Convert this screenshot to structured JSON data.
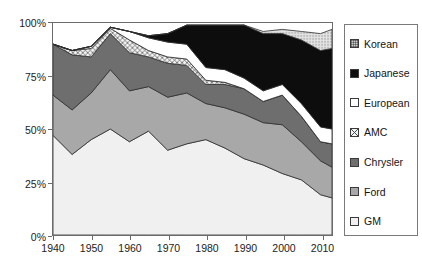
{
  "chart_data": {
    "type": "area",
    "stacked": true,
    "title": "",
    "subtitle": "",
    "xlabel": "",
    "ylabel": "",
    "xlim": [
      1940,
      2013
    ],
    "ylim": [
      0,
      100
    ],
    "grid": false,
    "legend_position": "right",
    "x_tick_labels": [
      "1940",
      "1950",
      "1960",
      "1970",
      "1980",
      "1990",
      "2000",
      "2010"
    ],
    "x_ticks": [
      1940,
      1950,
      1960,
      1970,
      1980,
      1990,
      2000,
      2010
    ],
    "y_tick_labels": [
      "0%",
      "25%",
      "50%",
      "75%",
      "100%"
    ],
    "y_ticks": [
      0,
      25,
      50,
      75,
      100
    ],
    "x": [
      1940,
      1945,
      1950,
      1955,
      1960,
      1965,
      1970,
      1975,
      1980,
      1985,
      1990,
      1995,
      2000,
      2005,
      2010,
      2013
    ],
    "series": [
      {
        "name": "GM",
        "fill": "#e6e6e6",
        "pattern": "solid",
        "values": [
          47,
          38,
          45,
          50,
          44,
          49,
          40,
          43,
          45,
          41,
          36,
          33,
          29,
          26,
          19,
          17.5
        ]
      },
      {
        "name": "Ford",
        "fill": "#a8a8a8",
        "pattern": "solid",
        "values": [
          19,
          21,
          22,
          28,
          24,
          21,
          25,
          24,
          17,
          19,
          21,
          20,
          23,
          18,
          16,
          14.5
        ]
      },
      {
        "name": "Chrysler",
        "fill": "#6e6e6e",
        "pattern": "solid",
        "values": [
          24,
          26,
          17,
          17,
          18,
          14,
          16,
          13,
          9,
          11,
          12,
          10,
          14,
          12,
          9,
          11
        ]
      },
      {
        "name": "AMC",
        "fill": "#f2f2f2",
        "pattern": "crosshatch",
        "values": [
          0,
          2,
          4,
          2.5,
          6,
          3,
          3,
          3,
          2,
          1,
          0,
          0,
          0,
          0,
          0,
          0
        ]
      },
      {
        "name": "European",
        "fill": "#ffffff",
        "pattern": "solid",
        "values": [
          0,
          0,
          1,
          0.5,
          4,
          6,
          7,
          7,
          6,
          6,
          5,
          5,
          5,
          6,
          7,
          7
        ]
      },
      {
        "name": "Japanese",
        "fill": "#0d0d0d",
        "pattern": "solid",
        "values": [
          0,
          0,
          0,
          0,
          0,
          1,
          4,
          9,
          20,
          21,
          25,
          27,
          24,
          30,
          36,
          38
        ]
      },
      {
        "name": "Korean",
        "fill": "#d2d2d2",
        "pattern": "dotted",
        "values": [
          0,
          0,
          0,
          0,
          0,
          0,
          0,
          0,
          0,
          0,
          0,
          1,
          2,
          4,
          8,
          9
        ]
      }
    ]
  },
  "legend": {
    "items": [
      {
        "label": "Korean",
        "swatch": "dotted-swatch"
      },
      {
        "label": "Japanese",
        "swatch": "black-swatch"
      },
      {
        "label": "European",
        "swatch": "white-swatch"
      },
      {
        "label": "AMC",
        "swatch": "crosshatch-swatch"
      },
      {
        "label": "Chrysler",
        "swatch": "darkgray-swatch"
      },
      {
        "label": "Ford",
        "swatch": "midgray-swatch"
      },
      {
        "label": "GM",
        "swatch": "lightgray-swatch"
      }
    ]
  },
  "axes": {
    "y_labels": [
      "100%",
      "75%",
      "50%",
      "25%",
      "0%"
    ],
    "x_labels": [
      "1940",
      "1950",
      "1960",
      "1970",
      "1980",
      "1990",
      "2000",
      "2010"
    ]
  }
}
